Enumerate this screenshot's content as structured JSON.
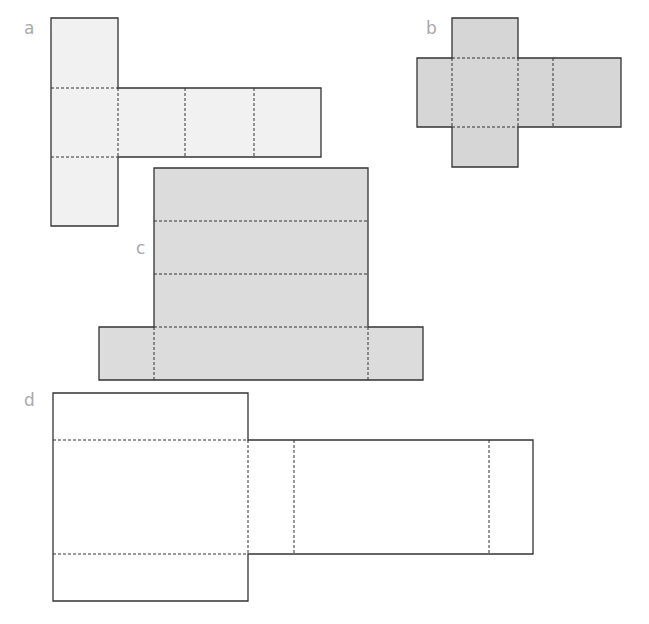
{
  "figure": {
    "labels": {
      "a": "a",
      "b": "b",
      "c": "c",
      "d": "d"
    },
    "colors": {
      "outline": "#333333",
      "fold_line": "#333333",
      "label": "#a9a9a9",
      "net_a_fill": "#f1f1f1",
      "net_b_fill": "#d6d6d6",
      "net_c_fill": "#dcdcdc",
      "net_d_fill": "#ffffff"
    },
    "nets": [
      {
        "id": "a",
        "shape": "cuboid net (T-shape)",
        "faces": 6
      },
      {
        "id": "b",
        "shape": "cuboid net (cross shape)",
        "faces": 6
      },
      {
        "id": "c",
        "shape": "cuboid net (hat shape)",
        "faces": 6
      },
      {
        "id": "d",
        "shape": "cuboid net",
        "faces": 6
      }
    ]
  }
}
